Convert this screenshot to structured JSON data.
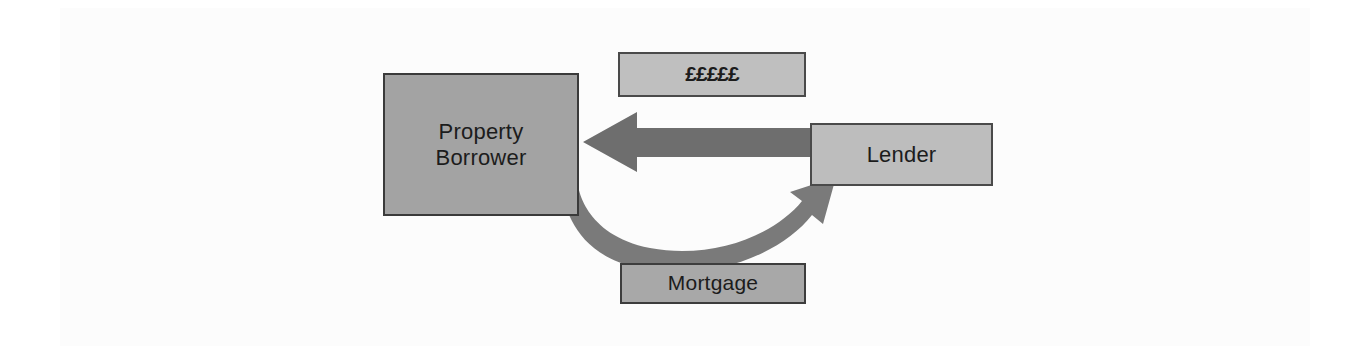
{
  "diagram": {
    "background_color": "#ffffff",
    "panel_color": "#fcfcfc",
    "nodes": [
      {
        "id": "borrower",
        "label_line1": "Property",
        "label_line2": "Borrower",
        "fill": "#a3a3a3",
        "border": "#3a3a3a"
      },
      {
        "id": "lender",
        "label": "Lender",
        "fill": "#bdbdbd",
        "border": "#4a4a4a"
      },
      {
        "id": "money",
        "label": "£££££",
        "fill": "#bfbfbf",
        "border": "#4a4a4a"
      },
      {
        "id": "mortgage",
        "label": "Mortgage",
        "fill": "#a8a8a8",
        "border": "#3d3d3d"
      }
    ],
    "arrows": [
      {
        "id": "money-flow",
        "from": "lender",
        "to": "borrower",
        "direction": "left",
        "style": "straight",
        "color": "#6e6e6e",
        "label_ref": "money"
      },
      {
        "id": "mortgage-flow",
        "from": "borrower",
        "to": "lender",
        "direction": "right",
        "style": "curved",
        "color": "#7a7a7a",
        "label_ref": "mortgage"
      }
    ]
  }
}
